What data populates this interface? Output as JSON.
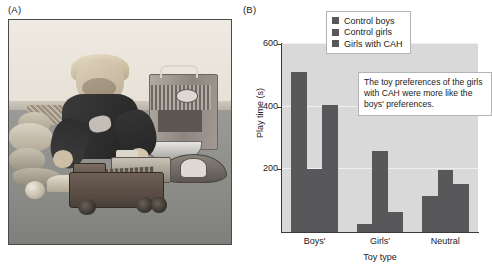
{
  "figure": {
    "panel_a_label": "(A)",
    "panel_b_label": "(B)"
  },
  "photo": {
    "alt_name": "boy-playing-with-toy-fire-trucks",
    "scene_items": [
      "young boy",
      "toy fire truck",
      "second toy truck",
      "metal bowl",
      "firefighter helmet",
      "toy locker",
      "stuffed animals",
      "ball",
      "wooden blocks"
    ]
  },
  "chart_data": {
    "type": "bar",
    "title": "",
    "xlabel": "Toy type",
    "ylabel": "Play time (s)",
    "categories": [
      "Boys'",
      "Girls'",
      "Neutral"
    ],
    "series": [
      {
        "name": "Control boys",
        "values": [
          510,
          25,
          115
        ],
        "color": "#58585a"
      },
      {
        "name": "Control girls",
        "values": [
          200,
          258,
          198
        ],
        "color": "#58585a"
      },
      {
        "name": "Girls with CAH",
        "values": [
          405,
          65,
          152
        ],
        "color": "#58585a"
      }
    ],
    "ylim": [
      0,
      600
    ],
    "yticks": [
      200,
      400,
      600
    ],
    "ytick_labels": [
      "200",
      "400",
      "600"
    ],
    "grid": true,
    "legend_position": "top-center",
    "plot_background": "#d9d9d9",
    "bar_color": "#58585a",
    "annotations": [
      {
        "name": "callout",
        "text": "The toy preferences of the girls with CAH were more like the boys' preferences."
      }
    ]
  }
}
